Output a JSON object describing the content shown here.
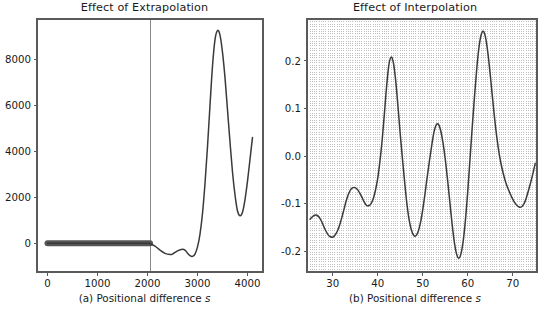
{
  "figure": {
    "width": 549,
    "height": 312,
    "background": "#ffffff",
    "line_color": "#3a3a3a",
    "axis_color": "#5a5a5a",
    "grid_color": "#b0b0b0",
    "marker_color": "#555555"
  },
  "chart_data": [
    {
      "type": "line",
      "panel": "a",
      "title": "Effect of Extrapolation",
      "xlabel": "(a) Positional difference s",
      "ylabel": "",
      "xlim": [
        -210,
        4310
      ],
      "ylim": [
        -1250,
        9750
      ],
      "xticks": [
        0,
        1000,
        2000,
        3000,
        4000
      ],
      "xticklabels": [
        "0",
        "1000",
        "2000",
        "3000",
        "4000"
      ],
      "yticks": [
        0,
        2000,
        4000,
        6000,
        8000
      ],
      "yticklabels": [
        "0",
        "2000",
        "4000",
        "6000",
        "8000"
      ],
      "grid": false,
      "legend": null,
      "annotations": [
        {
          "kind": "vline",
          "x": 2050,
          "label": "training/extrapolation boundary"
        }
      ],
      "series": [
        {
          "name": "observed (training range)",
          "style": "thick-band",
          "x": [
            0,
            100,
            200,
            300,
            400,
            500,
            600,
            700,
            800,
            900,
            1000,
            1100,
            1200,
            1300,
            1400,
            1500,
            1600,
            1700,
            1800,
            1900,
            2000,
            2050
          ],
          "values": [
            0,
            0,
            0,
            0,
            0,
            0,
            0,
            0,
            0,
            0,
            0,
            0,
            0,
            0,
            0,
            0,
            0,
            0,
            0,
            0,
            0,
            0
          ]
        },
        {
          "name": "extrapolated curve",
          "style": "line",
          "x": [
            0,
            500,
            1000,
            1500,
            2000,
            2050,
            2150,
            2250,
            2350,
            2450,
            2500,
            2600,
            2700,
            2750,
            2800,
            2850,
            2900,
            2950,
            3000,
            3050,
            3100,
            3150,
            3200,
            3250,
            3300,
            3350,
            3400,
            3450,
            3500,
            3550,
            3600,
            3650,
            3700,
            3750,
            3800,
            3850,
            3900,
            3950,
            4000,
            4050,
            4100
          ],
          "values": [
            0,
            0,
            0,
            0,
            0,
            -20,
            -120,
            -300,
            -440,
            -490,
            -470,
            -330,
            -260,
            -300,
            -430,
            -540,
            -570,
            -470,
            -160,
            400,
            1300,
            2600,
            4200,
            6000,
            7700,
            8850,
            9250,
            9050,
            8300,
            7200,
            5800,
            4400,
            3100,
            2100,
            1400,
            1200,
            1350,
            1900,
            2700,
            3650,
            4600
          ]
        }
      ]
    },
    {
      "type": "line",
      "panel": "b",
      "title": "Effect of Interpolation",
      "xlabel": "(b) Positional difference s",
      "ylabel": "",
      "xlim": [
        24.3,
        75.4
      ],
      "ylim": [
        -0.243,
        0.288
      ],
      "xticks": [
        30,
        40,
        50,
        60,
        70
      ],
      "xticklabels": [
        "30",
        "40",
        "50",
        "60",
        "70"
      ],
      "yticks": [
        -0.2,
        -0.1,
        0.0,
        0.1,
        0.2
      ],
      "yticklabels": [
        "-0.2",
        "-0.1",
        "0.0",
        "0.1",
        "0.2"
      ],
      "grid": true,
      "grid_axis": "x",
      "grid_style": "dotted",
      "grid_spacing": 0.5,
      "legend": null,
      "series": [
        {
          "name": "interpolated curve",
          "style": "line",
          "x": [
            25.0,
            25.5,
            26.0,
            26.5,
            27.0,
            27.5,
            28.0,
            28.5,
            29.0,
            29.5,
            30.0,
            30.5,
            31.0,
            31.5,
            32.0,
            32.5,
            33.0,
            33.5,
            34.0,
            34.5,
            35.0,
            35.5,
            36.0,
            36.5,
            37.0,
            37.5,
            38.0,
            38.5,
            39.0,
            39.5,
            40.0,
            40.5,
            41.0,
            41.5,
            42.0,
            42.5,
            43.0,
            43.5,
            44.0,
            44.5,
            45.0,
            45.5,
            46.0,
            46.5,
            47.0,
            47.5,
            48.0,
            48.5,
            49.0,
            49.5,
            50.0,
            50.5,
            51.0,
            51.5,
            52.0,
            52.5,
            53.0,
            53.5,
            54.0,
            54.5,
            55.0,
            55.5,
            56.0,
            56.5,
            57.0,
            57.5,
            58.0,
            58.5,
            59.0,
            59.5,
            60.0,
            60.5,
            61.0,
            61.5,
            62.0,
            62.5,
            63.0,
            63.5,
            64.0,
            64.5,
            65.0,
            65.5,
            66.0,
            66.5,
            67.0,
            67.5,
            68.0,
            68.5,
            69.0,
            69.5,
            70.0,
            70.5,
            71.0,
            71.5,
            72.0,
            72.5,
            73.0,
            73.5,
            74.0,
            74.5,
            75.0
          ],
          "values": [
            -0.132,
            -0.127,
            -0.124,
            -0.124,
            -0.128,
            -0.136,
            -0.147,
            -0.157,
            -0.165,
            -0.169,
            -0.17,
            -0.166,
            -0.158,
            -0.146,
            -0.13,
            -0.112,
            -0.094,
            -0.08,
            -0.07,
            -0.066,
            -0.066,
            -0.07,
            -0.077,
            -0.086,
            -0.096,
            -0.103,
            -0.104,
            -0.1,
            -0.09,
            -0.072,
            -0.047,
            -0.011,
            0.034,
            0.09,
            0.148,
            0.192,
            0.208,
            0.196,
            0.159,
            0.106,
            0.048,
            -0.005,
            -0.055,
            -0.1,
            -0.134,
            -0.155,
            -0.166,
            -0.167,
            -0.158,
            -0.14,
            -0.113,
            -0.08,
            -0.044,
            -0.01,
            0.022,
            0.05,
            0.066,
            0.067,
            0.054,
            0.029,
            -0.005,
            -0.047,
            -0.093,
            -0.139,
            -0.178,
            -0.204,
            -0.214,
            -0.205,
            -0.178,
            -0.134,
            -0.076,
            -0.008,
            0.06,
            0.124,
            0.182,
            0.228,
            0.255,
            0.262,
            0.248,
            0.216,
            0.172,
            0.124,
            0.078,
            0.038,
            0.005,
            -0.02,
            -0.04,
            -0.056,
            -0.069,
            -0.08,
            -0.09,
            -0.098,
            -0.104,
            -0.107,
            -0.106,
            -0.1,
            -0.088,
            -0.072,
            -0.055,
            -0.036,
            -0.015
          ]
        }
      ]
    }
  ]
}
